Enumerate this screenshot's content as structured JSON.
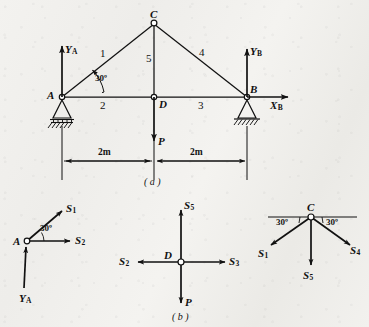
{
  "figure": {
    "line_color": "#111111",
    "paper_color": "#f1f0ed",
    "captions": {
      "part_a": "( a )",
      "part_b": "( b )"
    }
  },
  "truss": {
    "nodes": {
      "A": "A",
      "B": "B",
      "C": "C",
      "D": "D"
    },
    "members": [
      {
        "id": "1",
        "label": "1",
        "from": "A",
        "to": "C"
      },
      {
        "id": "2",
        "label": "2",
        "from": "A",
        "to": "D"
      },
      {
        "id": "3",
        "label": "3",
        "from": "D",
        "to": "B"
      },
      {
        "id": "4",
        "label": "4",
        "from": "C",
        "to": "B"
      },
      {
        "id": "5",
        "label": "5",
        "from": "C",
        "to": "D"
      }
    ],
    "angle": "30º",
    "reactions": {
      "YA": "Y",
      "YA_sub": "A",
      "YB": "Y",
      "YB_sub": "B",
      "XB": "X",
      "XB_sub": "B"
    },
    "load": {
      "label": "P"
    },
    "dimensions": [
      {
        "label": "2m",
        "span": "A to D"
      },
      {
        "label": "2m",
        "span": "D to B"
      }
    ]
  },
  "joint_a": {
    "node": "A",
    "angle": "30º",
    "forces": [
      {
        "symbol": "S",
        "sub": "1",
        "direction": "up-right-30deg"
      },
      {
        "symbol": "S",
        "sub": "2",
        "direction": "right"
      },
      {
        "symbol": "Y",
        "sub": "A",
        "direction": "up"
      }
    ]
  },
  "joint_d": {
    "node": "D",
    "forces": [
      {
        "symbol": "S",
        "sub": "5",
        "direction": "up"
      },
      {
        "symbol": "S",
        "sub": "2",
        "direction": "left"
      },
      {
        "symbol": "S",
        "sub": "3",
        "direction": "right"
      },
      {
        "symbol": "P",
        "sub": "",
        "direction": "down"
      }
    ]
  },
  "joint_c": {
    "node": "C",
    "angle_left": "30º",
    "angle_right": "30º",
    "forces": [
      {
        "symbol": "S",
        "sub": "1",
        "direction": "down-left-30deg"
      },
      {
        "symbol": "S",
        "sub": "4",
        "direction": "down-right-30deg"
      },
      {
        "symbol": "S",
        "sub": "5",
        "direction": "down"
      }
    ]
  }
}
